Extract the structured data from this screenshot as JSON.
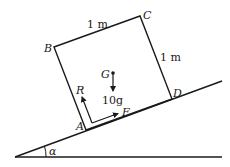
{
  "diagram": {
    "type": "block-on-inclined-plane",
    "colors": {
      "stroke": "#1a1a1a",
      "background": "#ffffff"
    },
    "vertices": {
      "A": "A",
      "B": "B",
      "C": "C",
      "D": "D",
      "G": "G"
    },
    "side_labels": {
      "BC": "1 m",
      "CD": "1 m"
    },
    "forces": {
      "normal": "R",
      "friction": "F",
      "weight": "10g"
    },
    "angle": "α"
  }
}
